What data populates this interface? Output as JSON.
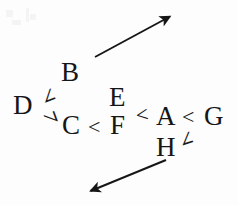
{
  "figure": {
    "background_color": "#fdfdfd",
    "ink_color": "#161616",
    "nodes": {
      "a": "A",
      "b": "B",
      "c": "C",
      "d": "D",
      "e": "E",
      "f": "F",
      "g": "G",
      "h": "H"
    },
    "relations": {
      "c_lt_f": "<",
      "f_lt_a": "<",
      "a_lt_g": "<",
      "d_lt_b_angle": "∠",
      "d_lt_c_angle": "∠",
      "h_lt_a_angle": "∠"
    },
    "arrows": [
      {
        "name": "upper-right-arrow",
        "direction": "up-right",
        "x1": 95,
        "y1": 57,
        "x2": 172,
        "y2": 15
      },
      {
        "name": "lower-left-arrow",
        "direction": "down-left",
        "x1": 166,
        "y1": 160,
        "x2": 88,
        "y2": 192
      }
    ],
    "reading": "D < B, D < C, C < F, F < A, A < G, H < A"
  }
}
